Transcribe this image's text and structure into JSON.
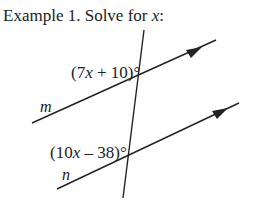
{
  "title": {
    "prefix": "Example 1.  Solve for ",
    "variable": "x",
    "suffix": ":"
  },
  "diagram": {
    "angle_top": {
      "open": "(7",
      "var": "x",
      "rest": " + 10)°"
    },
    "angle_bottom": {
      "open": "(10",
      "var": "x",
      "rest": " – 38)°"
    },
    "line_m_label": "m",
    "line_n_label": "n",
    "line_color": "#222222"
  }
}
